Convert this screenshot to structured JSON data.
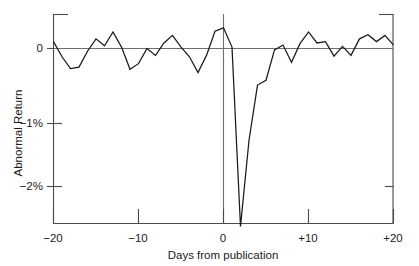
{
  "chart_data": {
    "type": "line",
    "title": "",
    "xlabel": "Days from publication",
    "ylabel": "Abnormal Return",
    "xlim": [
      -20,
      20
    ],
    "ylim": [
      -2.6,
      0.45
    ],
    "grid": false,
    "legend": false,
    "zero_line": true,
    "x_tick_labels": [
      "−20",
      "−10",
      "0",
      "+10",
      "+20"
    ],
    "x_tick_values": [
      -20,
      -10,
      0,
      10,
      20
    ],
    "y_tick_labels": [
      "0",
      "−1%",
      "−2%"
    ],
    "y_tick_values": [
      0,
      -1,
      -2
    ],
    "y_unit": "percent",
    "series": [
      {
        "name": "Abnormal Return",
        "color": "#1a1a1a",
        "x": [
          -20,
          -19,
          -18,
          -17,
          -16,
          -15,
          -14,
          -13,
          -12,
          -11,
          -10,
          -9,
          -8,
          -7,
          -6,
          -5,
          -4,
          -3,
          -2,
          -1,
          0,
          1,
          2,
          3,
          4,
          5,
          6,
          7,
          8,
          9,
          10,
          11,
          12,
          13,
          14,
          15,
          16,
          17,
          18,
          19,
          20
        ],
        "values": [
          0.1,
          -0.12,
          -0.29,
          -0.27,
          -0.04,
          0.14,
          0.04,
          0.24,
          0.02,
          -0.3,
          -0.22,
          0.0,
          -0.1,
          0.08,
          0.19,
          0.02,
          -0.12,
          -0.35,
          -0.1,
          0.25,
          0.3,
          0.02,
          -2.58,
          -1.33,
          -0.53,
          -0.46,
          -0.02,
          0.05,
          -0.2,
          0.07,
          0.24,
          0.08,
          0.1,
          -0.11,
          0.03,
          -0.1,
          0.14,
          0.2,
          0.1,
          0.19,
          0.05
        ],
        "annotations": {
          "event_day": 0,
          "trough_day": 2,
          "trough_value": -2.58
        }
      }
    ]
  },
  "axes": {
    "y_axis_label": "Abnormal Return",
    "x_axis_label": "Days from publication",
    "y_ticks": [
      {
        "label": "0",
        "value": 0
      },
      {
        "label": "−1%",
        "value": -1
      },
      {
        "label": "−2%",
        "value": -2
      }
    ],
    "x_ticks": [
      {
        "label": "−20",
        "value": -20
      },
      {
        "label": "−10",
        "value": -10
      },
      {
        "label": "0",
        "value": 0
      },
      {
        "label": "+10",
        "value": 10
      },
      {
        "label": "+20",
        "value": 20
      }
    ]
  },
  "style": {
    "line_color": "#1a1a1a",
    "axis_color": "#4a4a4a",
    "zero_line_color": "#6e6e6e",
    "background": "#ffffff"
  }
}
